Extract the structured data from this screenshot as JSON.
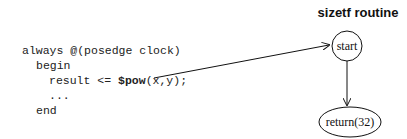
{
  "code": {
    "lines": [
      {
        "indent": 0,
        "text": "always @(posedge clock)"
      },
      {
        "indent": 1,
        "text": "begin"
      },
      {
        "indent": 2,
        "prefix": "result <= ",
        "bold": "$pow",
        "suffix": "(x,y);"
      },
      {
        "indent": 2,
        "text": "..."
      },
      {
        "indent": 1,
        "text": "end"
      }
    ]
  },
  "diagram": {
    "title": "sizetf routine",
    "nodes": [
      {
        "id": "start",
        "label": "start",
        "shape": "circle"
      },
      {
        "id": "return",
        "label": "return(32)",
        "shape": "ellipse"
      }
    ],
    "edges": [
      {
        "from": "code.$pow",
        "to": "start"
      },
      {
        "from": "start",
        "to": "return"
      }
    ]
  }
}
